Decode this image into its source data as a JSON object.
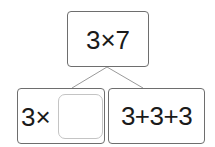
{
  "diagram": {
    "type": "tree",
    "root": {
      "expression": "3×7"
    },
    "children": [
      {
        "expression_prefix": "3×",
        "blank": true
      },
      {
        "expression": "3+3+3"
      }
    ],
    "colors": {
      "box_border": "#6e6e6e",
      "blank_border": "#c4c4c4",
      "connector": "#9a9a9a",
      "text": "#1a1a1a",
      "background": "#ffffff"
    }
  }
}
